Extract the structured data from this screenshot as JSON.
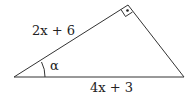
{
  "diagram": {
    "type": "right-triangle",
    "labels": {
      "hypotenuse_side": "2x + 6",
      "base": "4x + 3",
      "angle": "α"
    },
    "right_angle_marker": "square-with-dot",
    "stroke_color": "#333333"
  }
}
